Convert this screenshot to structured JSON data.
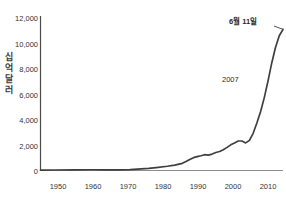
{
  "title_fragment": "· · ·  · ·  · · · ·  ·· ··  ·· ·· · ·",
  "axis": {
    "y_label_chars": [
      "십",
      "억",
      "달",
      "러"
    ],
    "y_label_text": "십억 달러",
    "y_ticks": [
      "0",
      "2,000",
      "4,000",
      "6,000",
      "8,000",
      "10,000",
      "12,000"
    ],
    "x_ticks": [
      "1950",
      "1960",
      "1970",
      "1980",
      "1990",
      "2000",
      "2010"
    ]
  },
  "annotations": {
    "year_marker": "2007",
    "end_marker": "6월 11일"
  },
  "colors": {
    "line": "#3f3f3f",
    "axis": "#4a4a4a",
    "text": "#2b2b2b",
    "background": "#ffffff"
  },
  "chart_data": {
    "type": "line",
    "title": "",
    "xlabel": "",
    "ylabel": "십억 달러",
    "xlim": [
      1946,
      2011
    ],
    "ylim": [
      0,
      12000
    ],
    "grid": false,
    "legend": null,
    "x": [
      1946,
      1950,
      1955,
      1960,
      1963,
      1965,
      1967,
      1970,
      1972,
      1975,
      1977,
      1980,
      1982,
      1984,
      1985,
      1986,
      1987,
      1988,
      1989,
      1990,
      1991,
      1992,
      1993,
      1994,
      1995,
      1996,
      1997,
      1998,
      1999,
      2000,
      2001,
      2002,
      2003,
      2004,
      2005,
      2006,
      2007,
      2008,
      2009,
      2010,
      2011
    ],
    "values": [
      30,
      40,
      50,
      60,
      55,
      50,
      45,
      70,
      110,
      170,
      230,
      330,
      420,
      560,
      700,
      860,
      1000,
      1080,
      1150,
      1230,
      1200,
      1280,
      1400,
      1480,
      1620,
      1800,
      2000,
      2150,
      2300,
      2300,
      2150,
      2350,
      2900,
      3700,
      4600,
      5700,
      7000,
      8400,
      9600,
      10500,
      11000
    ],
    "annotations": [
      {
        "label": "2007",
        "x": 2007,
        "y": 7000
      },
      {
        "label": "6월 11일",
        "x": 2011,
        "y": 11000
      }
    ],
    "series": [
      {
        "name": "",
        "values": [
          30,
          40,
          50,
          60,
          55,
          50,
          45,
          70,
          110,
          170,
          230,
          330,
          420,
          560,
          700,
          860,
          1000,
          1080,
          1150,
          1230,
          1200,
          1280,
          1400,
          1480,
          1620,
          1800,
          2000,
          2150,
          2300,
          2300,
          2150,
          2350,
          2900,
          3700,
          4600,
          5700,
          7000,
          8400,
          9600,
          10500,
          11000
        ]
      }
    ]
  }
}
